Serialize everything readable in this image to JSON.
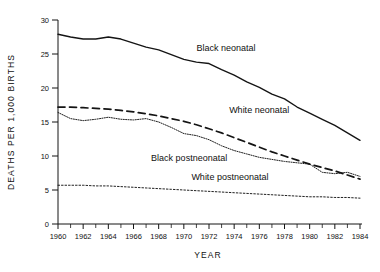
{
  "chart_data": {
    "type": "line",
    "title": "",
    "xlabel": "YEAR",
    "ylabel": "DEATHS PER 1,000 BIRTHS",
    "xlim": [
      1960,
      1984
    ],
    "ylim": [
      0,
      30
    ],
    "grid": false,
    "legend_position": "inline-annotations",
    "x": [
      1960,
      1961,
      1962,
      1963,
      1964,
      1965,
      1966,
      1967,
      1968,
      1969,
      1970,
      1971,
      1972,
      1973,
      1974,
      1975,
      1976,
      1977,
      1978,
      1979,
      1980,
      1981,
      1982,
      1983,
      1984
    ],
    "yticks": [
      0,
      5,
      10,
      15,
      20,
      25,
      30
    ],
    "ytick_labels": [
      "0",
      "5",
      "10",
      "15",
      "20",
      "25",
      "30"
    ],
    "xticks": [
      1960,
      1962,
      1964,
      1966,
      1968,
      1970,
      1972,
      1974,
      1976,
      1978,
      1980,
      1982,
      1984
    ],
    "xtick_labels": [
      "1960",
      "1962",
      "1964",
      "1966",
      "1968",
      "1970",
      "1972",
      "1974",
      "1976",
      "1978",
      "1980",
      "1982",
      "1984"
    ],
    "xtick_minor": [
      1961,
      1963,
      1965,
      1967,
      1969,
      1971,
      1973,
      1975,
      1977,
      1979,
      1981,
      1983
    ],
    "series": [
      {
        "name": "Black neonatal",
        "style": "solid",
        "color": "#141414",
        "label_x": 1971.0,
        "label_y": 25.4,
        "values": [
          27.9,
          27.5,
          27.2,
          27.2,
          27.5,
          27.2,
          26.6,
          26.0,
          25.6,
          24.9,
          24.2,
          23.8,
          23.6,
          22.7,
          21.9,
          20.9,
          20.1,
          19.1,
          18.4,
          17.2,
          16.3,
          15.4,
          14.5,
          13.4,
          12.3
        ]
      },
      {
        "name": "White neonatal",
        "style": "dashed",
        "color": "#141414",
        "label_x": 1973.6,
        "label_y": 16.3,
        "values": [
          17.2,
          17.2,
          17.1,
          17.0,
          16.9,
          16.7,
          16.5,
          16.2,
          15.9,
          15.5,
          15.1,
          14.6,
          14.0,
          13.4,
          12.7,
          12.0,
          11.3,
          10.6,
          10.0,
          9.4,
          8.8,
          8.3,
          7.8,
          7.2,
          6.6
        ]
      },
      {
        "name": "Black postneonatal",
        "style": "dotted-fine",
        "color": "#141414",
        "label_x": 1967.4,
        "label_y": 9.3,
        "values": [
          16.4,
          15.5,
          15.2,
          15.4,
          15.7,
          15.4,
          15.3,
          15.5,
          15.0,
          14.2,
          13.3,
          13.0,
          12.4,
          11.5,
          10.8,
          10.3,
          9.8,
          9.5,
          9.2,
          9.0,
          8.8,
          7.6,
          7.4,
          7.6,
          7.0
        ]
      },
      {
        "name": "White postneonatal",
        "style": "dotted",
        "color": "#141414",
        "label_x": 1970.6,
        "label_y": 6.4,
        "values": [
          5.7,
          5.7,
          5.7,
          5.6,
          5.6,
          5.5,
          5.4,
          5.3,
          5.2,
          5.1,
          5.0,
          4.9,
          4.8,
          4.7,
          4.6,
          4.5,
          4.4,
          4.3,
          4.2,
          4.1,
          4.0,
          4.0,
          3.9,
          3.9,
          3.8
        ]
      }
    ]
  }
}
